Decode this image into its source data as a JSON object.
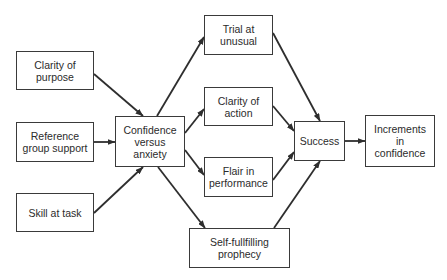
{
  "diagram": {
    "type": "flow",
    "nodes": [
      {
        "id": "clarity_purpose",
        "label": "Clarity of\npurpose",
        "x": 16,
        "y": 51,
        "w": 78,
        "h": 39
      },
      {
        "id": "reference_group",
        "label": "Reference\ngroup support",
        "x": 16,
        "y": 122,
        "w": 78,
        "h": 40
      },
      {
        "id": "skill_task",
        "label": "Skill at task",
        "x": 16,
        "y": 193,
        "w": 78,
        "h": 39
      },
      {
        "id": "confidence_anxiety",
        "label": "Confidence\nversus\nanxiety",
        "x": 115,
        "y": 116,
        "w": 70,
        "h": 51
      },
      {
        "id": "trial_unusual",
        "label": "Trial at\nunusual",
        "x": 204,
        "y": 15,
        "w": 69,
        "h": 40
      },
      {
        "id": "clarity_action",
        "label": "Clarity of\naction",
        "x": 204,
        "y": 87,
        "w": 69,
        "h": 39
      },
      {
        "id": "flair_performance",
        "label": "Flair in\nperformance",
        "x": 204,
        "y": 157,
        "w": 69,
        "h": 40
      },
      {
        "id": "self_fulfilling",
        "label": "Self-fullfilling\nprophecy",
        "x": 189,
        "y": 228,
        "w": 101,
        "h": 40
      },
      {
        "id": "success",
        "label": "Success",
        "x": 294,
        "y": 121,
        "w": 51,
        "h": 40
      },
      {
        "id": "increments_confidence",
        "label": "Increments\nin\nconfidence",
        "x": 365,
        "y": 115,
        "w": 70,
        "h": 52
      }
    ],
    "edges": [
      {
        "from": "clarity_purpose",
        "to": "confidence_anxiety",
        "x1": 94,
        "y1": 74,
        "x2": 143,
        "y2": 116
      },
      {
        "from": "reference_group",
        "to": "confidence_anxiety",
        "x1": 94,
        "y1": 142,
        "x2": 115,
        "y2": 142
      },
      {
        "from": "skill_task",
        "to": "confidence_anxiety",
        "x1": 94,
        "y1": 213,
        "x2": 143,
        "y2": 167
      },
      {
        "from": "confidence_anxiety",
        "to": "trial_unusual",
        "x1": 157,
        "y1": 116,
        "x2": 204,
        "y2": 37
      },
      {
        "from": "confidence_anxiety",
        "to": "clarity_action",
        "x1": 185,
        "y1": 133,
        "x2": 204,
        "y2": 109
      },
      {
        "from": "confidence_anxiety",
        "to": "flair_performance",
        "x1": 185,
        "y1": 150,
        "x2": 204,
        "y2": 175
      },
      {
        "from": "confidence_anxiety",
        "to": "self_fulfilling",
        "x1": 158,
        "y1": 167,
        "x2": 205,
        "y2": 228
      },
      {
        "from": "trial_unusual",
        "to": "success",
        "x1": 273,
        "y1": 33,
        "x2": 320,
        "y2": 121
      },
      {
        "from": "clarity_action",
        "to": "success",
        "x1": 273,
        "y1": 106,
        "x2": 294,
        "y2": 131
      },
      {
        "from": "flair_performance",
        "to": "success",
        "x1": 273,
        "y1": 180,
        "x2": 294,
        "y2": 152
      },
      {
        "from": "self_fulfilling",
        "to": "success",
        "x1": 274,
        "y1": 228,
        "x2": 320,
        "y2": 161
      },
      {
        "from": "success",
        "to": "increments_confidence",
        "x1": 345,
        "y1": 141,
        "x2": 365,
        "y2": 141
      }
    ],
    "colors": {
      "stroke": "#2e2e2e",
      "text": "#2b2b2b",
      "background": "#ffffff"
    }
  }
}
